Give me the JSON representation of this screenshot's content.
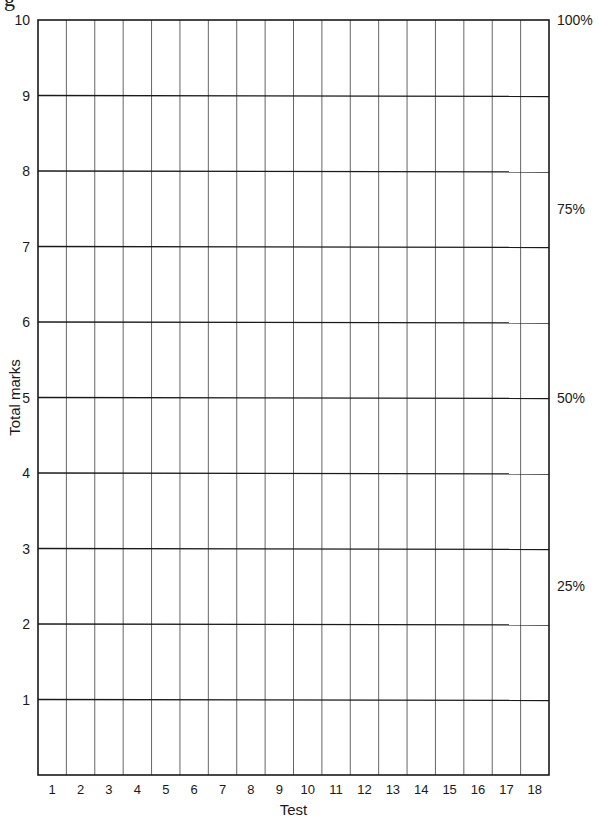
{
  "page": {
    "cut_glyph": "g"
  },
  "chart_data": {
    "type": "line",
    "title": "",
    "xlabel": "Test",
    "ylabel": "Total marks",
    "categories": [
      "1",
      "2",
      "3",
      "4",
      "5",
      "6",
      "7",
      "8",
      "9",
      "10",
      "11",
      "12",
      "13",
      "14",
      "15",
      "16",
      "17",
      "18"
    ],
    "series": [],
    "ylim": [
      0,
      10
    ],
    "y_ticks": [
      1,
      2,
      3,
      4,
      5,
      6,
      7,
      8,
      9,
      10
    ],
    "secondary_y_ticks": [
      {
        "label": "100%",
        "value": 10
      },
      {
        "label": "75%",
        "value": 7.5
      },
      {
        "label": "50%",
        "value": 5
      },
      {
        "label": "25%",
        "value": 2.5
      }
    ],
    "grid": true,
    "legend": "none",
    "note": "Blank grid for recording test marks; no data plotted"
  },
  "style": {
    "line_color": "#1a1a1a",
    "grid_color": "#333333",
    "background": "#ffffff"
  }
}
